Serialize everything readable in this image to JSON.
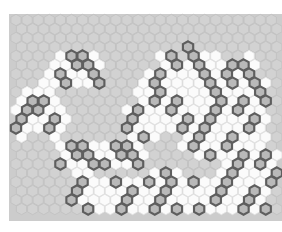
{
  "app": {
    "title": "Hexagonal Cell Grid",
    "canvas_width": 282,
    "canvas_height": 232,
    "background_color": "#ffffff"
  },
  "board": {
    "name": "hexagonal-tiling-board",
    "columns": 24,
    "rows": 22,
    "origin_x": 16,
    "origin_y": 20,
    "hex_width": 11.1,
    "hex_height": 12.4,
    "row_step": 9.0,
    "col_step": 11.1,
    "orientation": "pointy-top",
    "legend": {
      "empty_label": "empty",
      "cleared_label": "cleared",
      "marked_label": "marked"
    },
    "colors": {
      "empty_fill": "#d2d2d2",
      "empty_stroke": "#c2c2c2",
      "cleared_fill": "#fbfbfb",
      "cleared_stroke": "#e2e2e2",
      "marked_fill": "#b9b9b9",
      "marked_stroke": "#5e5e5e",
      "marked_stroke_width": 2.1,
      "board_backdrop": "#cccccc"
    },
    "counts": {
      "marked_total": 96,
      "cleared_total": 150
    },
    "cells": {
      "marked": [
        [
          3,
          15
        ],
        [
          4,
          5
        ],
        [
          4,
          6
        ],
        [
          4,
          14
        ],
        [
          4,
          16
        ],
        [
          5,
          5
        ],
        [
          5,
          6
        ],
        [
          5,
          14
        ],
        [
          5,
          16
        ],
        [
          5,
          19
        ],
        [
          5,
          20
        ],
        [
          6,
          4
        ],
        [
          6,
          7
        ],
        [
          6,
          13
        ],
        [
          6,
          17
        ],
        [
          6,
          19
        ],
        [
          6,
          21
        ],
        [
          7,
          4
        ],
        [
          7,
          7
        ],
        [
          7,
          12
        ],
        [
          7,
          17
        ],
        [
          7,
          19
        ],
        [
          7,
          21
        ],
        [
          8,
          13
        ],
        [
          8,
          18
        ],
        [
          8,
          22
        ],
        [
          9,
          1
        ],
        [
          9,
          2
        ],
        [
          9,
          12
        ],
        [
          9,
          14
        ],
        [
          9,
          18
        ],
        [
          9,
          20
        ],
        [
          9,
          22
        ],
        [
          10,
          1
        ],
        [
          10,
          2
        ],
        [
          10,
          11
        ],
        [
          10,
          14
        ],
        [
          10,
          18
        ],
        [
          10,
          20
        ],
        [
          11,
          0
        ],
        [
          11,
          3
        ],
        [
          11,
          10
        ],
        [
          11,
          15
        ],
        [
          11,
          17
        ],
        [
          11,
          21
        ],
        [
          12,
          0
        ],
        [
          12,
          3
        ],
        [
          12,
          10
        ],
        [
          12,
          15
        ],
        [
          12,
          17
        ],
        [
          12,
          21
        ],
        [
          13,
          11
        ],
        [
          13,
          16
        ],
        [
          13,
          19
        ],
        [
          14,
          5
        ],
        [
          14,
          6
        ],
        [
          14,
          9
        ],
        [
          14,
          10
        ],
        [
          14,
          16
        ],
        [
          14,
          19
        ],
        [
          15,
          5
        ],
        [
          15,
          6
        ],
        [
          15,
          9
        ],
        [
          15,
          10
        ],
        [
          15,
          17
        ],
        [
          15,
          20
        ],
        [
          15,
          22
        ],
        [
          16,
          4
        ],
        [
          16,
          7
        ],
        [
          16,
          8
        ],
        [
          16,
          11
        ],
        [
          16,
          20
        ],
        [
          16,
          22
        ],
        [
          17,
          13
        ],
        [
          17,
          19
        ],
        [
          17,
          23
        ],
        [
          18,
          6
        ],
        [
          18,
          9
        ],
        [
          18,
          12
        ],
        [
          18,
          14
        ],
        [
          18,
          16
        ],
        [
          18,
          19
        ],
        [
          18,
          23
        ],
        [
          19,
          5
        ],
        [
          19,
          10
        ],
        [
          19,
          13
        ],
        [
          19,
          18
        ],
        [
          19,
          21
        ],
        [
          20,
          5
        ],
        [
          20,
          10
        ],
        [
          20,
          13
        ],
        [
          20,
          18
        ],
        [
          20,
          21
        ],
        [
          21,
          6
        ],
        [
          21,
          9
        ],
        [
          21,
          12
        ],
        [
          21,
          14
        ],
        [
          21,
          16
        ],
        [
          21,
          20
        ],
        [
          21,
          22
        ]
      ],
      "cleared": [
        [
          4,
          4
        ],
        [
          4,
          7
        ],
        [
          4,
          13
        ],
        [
          4,
          17
        ],
        [
          4,
          18
        ],
        [
          4,
          21
        ],
        [
          5,
          3
        ],
        [
          5,
          4
        ],
        [
          5,
          7
        ],
        [
          5,
          13
        ],
        [
          5,
          15
        ],
        [
          5,
          17
        ],
        [
          5,
          18
        ],
        [
          5,
          21
        ],
        [
          6,
          3
        ],
        [
          6,
          5
        ],
        [
          6,
          6
        ],
        [
          6,
          12
        ],
        [
          6,
          14
        ],
        [
          6,
          15
        ],
        [
          6,
          16
        ],
        [
          6,
          18
        ],
        [
          6,
          20
        ],
        [
          7,
          2
        ],
        [
          7,
          3
        ],
        [
          7,
          5
        ],
        [
          7,
          6
        ],
        [
          7,
          11
        ],
        [
          7,
          13
        ],
        [
          7,
          14
        ],
        [
          7,
          15
        ],
        [
          7,
          16
        ],
        [
          7,
          18
        ],
        [
          7,
          20
        ],
        [
          7,
          22
        ],
        [
          8,
          1
        ],
        [
          8,
          2
        ],
        [
          8,
          3
        ],
        [
          8,
          11
        ],
        [
          8,
          12
        ],
        [
          8,
          14
        ],
        [
          8,
          15
        ],
        [
          8,
          16
        ],
        [
          8,
          17
        ],
        [
          8,
          19
        ],
        [
          8,
          20
        ],
        [
          8,
          21
        ],
        [
          9,
          0
        ],
        [
          9,
          3
        ],
        [
          9,
          11
        ],
        [
          9,
          13
        ],
        [
          9,
          15
        ],
        [
          9,
          16
        ],
        [
          9,
          17
        ],
        [
          9,
          19
        ],
        [
          9,
          21
        ],
        [
          10,
          0
        ],
        [
          10,
          3
        ],
        [
          10,
          4
        ],
        [
          10,
          10
        ],
        [
          10,
          12
        ],
        [
          10,
          13
        ],
        [
          10,
          15
        ],
        [
          10,
          16
        ],
        [
          10,
          17
        ],
        [
          10,
          19
        ],
        [
          10,
          21
        ],
        [
          10,
          22
        ],
        [
          11,
          1
        ],
        [
          11,
          2
        ],
        [
          11,
          4
        ],
        [
          11,
          11
        ],
        [
          11,
          12
        ],
        [
          11,
          13
        ],
        [
          11,
          14
        ],
        [
          11,
          16
        ],
        [
          11,
          18
        ],
        [
          11,
          19
        ],
        [
          11,
          20
        ],
        [
          11,
          22
        ],
        [
          12,
          1
        ],
        [
          12,
          2
        ],
        [
          12,
          4
        ],
        [
          12,
          11
        ],
        [
          12,
          12
        ],
        [
          12,
          13
        ],
        [
          12,
          14
        ],
        [
          12,
          16
        ],
        [
          12,
          18
        ],
        [
          12,
          19
        ],
        [
          12,
          20
        ],
        [
          12,
          22
        ],
        [
          13,
          0
        ],
        [
          13,
          3
        ],
        [
          13,
          10
        ],
        [
          13,
          12
        ],
        [
          13,
          15
        ],
        [
          13,
          17
        ],
        [
          13,
          18
        ],
        [
          13,
          20
        ],
        [
          13,
          21
        ],
        [
          13,
          22
        ],
        [
          14,
          4
        ],
        [
          14,
          7
        ],
        [
          14,
          8
        ],
        [
          14,
          11
        ],
        [
          14,
          15
        ],
        [
          14,
          17
        ],
        [
          14,
          18
        ],
        [
          14,
          20
        ],
        [
          14,
          21
        ],
        [
          14,
          22
        ],
        [
          15,
          4
        ],
        [
          15,
          7
        ],
        [
          15,
          8
        ],
        [
          15,
          11
        ],
        [
          15,
          16
        ],
        [
          15,
          18
        ],
        [
          15,
          19
        ],
        [
          15,
          21
        ],
        [
          15,
          23
        ],
        [
          16,
          5
        ],
        [
          16,
          6
        ],
        [
          16,
          9
        ],
        [
          16,
          10
        ],
        [
          16,
          19
        ],
        [
          16,
          21
        ],
        [
          16,
          23
        ],
        [
          17,
          5
        ],
        [
          17,
          6
        ],
        [
          17,
          12
        ],
        [
          17,
          14
        ],
        [
          17,
          18
        ],
        [
          17,
          20
        ],
        [
          17,
          21
        ],
        [
          17,
          22
        ],
        [
          18,
          7
        ],
        [
          18,
          8
        ],
        [
          18,
          10
        ],
        [
          18,
          11
        ],
        [
          18,
          13
        ],
        [
          18,
          15
        ],
        [
          18,
          17
        ],
        [
          18,
          18
        ],
        [
          18,
          20
        ],
        [
          18,
          21
        ],
        [
          18,
          22
        ],
        [
          19,
          6
        ],
        [
          19,
          7
        ],
        [
          19,
          8
        ],
        [
          19,
          9
        ],
        [
          19,
          11
        ],
        [
          19,
          12
        ],
        [
          19,
          14
        ],
        [
          19,
          15
        ],
        [
          19,
          16
        ],
        [
          19,
          17
        ],
        [
          19,
          19
        ],
        [
          19,
          20
        ],
        [
          19,
          22
        ],
        [
          20,
          6
        ],
        [
          20,
          7
        ],
        [
          20,
          8
        ],
        [
          20,
          9
        ],
        [
          20,
          11
        ],
        [
          20,
          12
        ],
        [
          20,
          14
        ],
        [
          20,
          15
        ],
        [
          20,
          16
        ],
        [
          20,
          17
        ],
        [
          20,
          19
        ],
        [
          20,
          20
        ],
        [
          20,
          22
        ],
        [
          21,
          7
        ],
        [
          21,
          8
        ],
        [
          21,
          10
        ],
        [
          21,
          11
        ],
        [
          21,
          13
        ],
        [
          21,
          15
        ],
        [
          21,
          17
        ],
        [
          21,
          18
        ],
        [
          21,
          19
        ],
        [
          21,
          21
        ]
      ]
    }
  }
}
